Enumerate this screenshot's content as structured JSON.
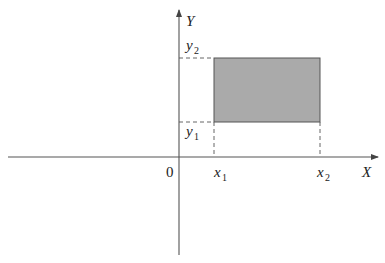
{
  "diagram": {
    "title": "",
    "axes": {
      "x_label": "X",
      "y_label": "Y",
      "origin_label": "0"
    },
    "rectangle": {
      "fill": "#aaaaaa",
      "stroke": "#555555",
      "x1_label": "x",
      "x1_sub": "1",
      "x2_label": "x",
      "x2_sub": "2",
      "y1_label": "y",
      "y1_sub": "1",
      "y2_label": "y",
      "y2_sub": "2"
    },
    "colors": {
      "axis": "#555555",
      "dashed": "#555555",
      "rect_fill": "#aaaaaa"
    }
  }
}
